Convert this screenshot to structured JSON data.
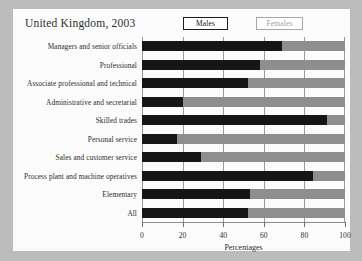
{
  "chart_data": {
    "type": "bar",
    "orientation": "horizontal",
    "stacked": true,
    "title": "United Kingdom, 2003",
    "xlabel": "Percentages",
    "ylabel": "",
    "xlim": [
      0,
      100
    ],
    "xticks": [
      0,
      20,
      40,
      60,
      80,
      100
    ],
    "grid": true,
    "legend_position": "top",
    "categories": [
      "Managers and senior officials",
      "Professional",
      "Associate professional and technical",
      "Administrative and secretarial",
      "Skilled trades",
      "Personal service",
      "Sales and customer service",
      "Process plant and machine operatives",
      "Elementary",
      "All"
    ],
    "series": [
      {
        "name": "Males",
        "color": "#161616",
        "values": [
          69,
          58,
          52,
          20,
          91,
          17,
          29,
          84,
          53,
          52
        ]
      },
      {
        "name": "Females",
        "color": "#8e8e8e",
        "values": [
          31,
          42,
          48,
          80,
          9,
          83,
          71,
          16,
          47,
          48
        ]
      }
    ]
  },
  "legend": {
    "males_label": "Males",
    "females_label": "Females"
  },
  "colors": {
    "male_bar": "#161616",
    "female_bar": "#8e8e8e",
    "card_background": "#fbfbfb",
    "page_background": "#bcbcbc"
  }
}
